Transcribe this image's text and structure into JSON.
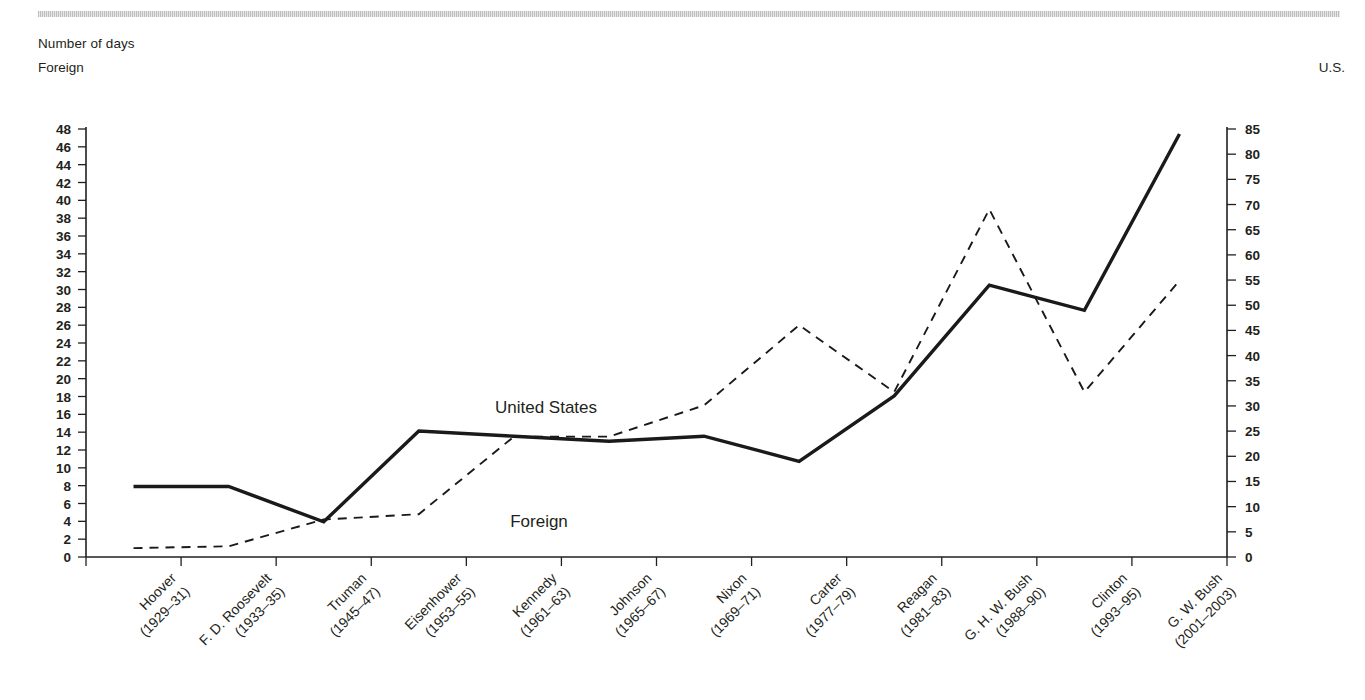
{
  "header": {
    "axis_units_title": "Number of days",
    "left_axis_name": "Foreign",
    "right_axis_name": "U.S."
  },
  "series_labels": {
    "us": "United States",
    "foreign": "Foreign"
  },
  "chart_data": {
    "type": "line",
    "title": "Number of days",
    "xlabel": "",
    "ylabel": "Foreign",
    "y2label": "U.S.",
    "ylim": [
      0,
      48
    ],
    "y2lim": [
      0,
      85
    ],
    "grid": false,
    "legend": "inline-annotations",
    "categories": [
      "Hoover\n(1929–31)",
      "F. D. Roosevelt\n(1933–35)",
      "Truman\n(1945–47)",
      "Eisenhower\n(1953–55)",
      "Kennedy\n(1961–63)",
      "Johnson\n(1965–67)",
      "Nixon\n(1969–71)",
      "Carter\n(1977–79)",
      "Reagan\n(1981–83)",
      "G. H. W. Bush\n(1988–90)",
      "Clinton\n(1993–95)",
      "G. W. Bush\n(2001–2003)"
    ],
    "category_names": [
      "Hoover",
      "F. D. Roosevelt",
      "Truman",
      "Eisenhower",
      "Kennedy",
      "Johnson",
      "Nixon",
      "Carter",
      "Reagan",
      "G. H. W. Bush",
      "Clinton",
      "G. W. Bush"
    ],
    "category_years": [
      "(1929–31)",
      "(1933–35)",
      "(1945–47)",
      "(1953–55)",
      "(1961–63)",
      "(1965–67)",
      "(1969–71)",
      "(1977–79)",
      "(1981–83)",
      "(1988–90)",
      "(1993–95)",
      "(2001–2003)"
    ],
    "series": [
      {
        "name": "United States",
        "axis": "right",
        "style": "solid",
        "values": [
          14,
          14,
          7,
          25,
          24,
          23,
          24,
          19,
          32,
          54,
          49,
          84
        ]
      },
      {
        "name": "Foreign",
        "axis": "left",
        "style": "dashed",
        "values": [
          1,
          1.2,
          4.2,
          4.8,
          13.5,
          13.5,
          17,
          26,
          18.5,
          39,
          18.5,
          31
        ]
      }
    ],
    "left_ticks": [
      0,
      2,
      4,
      6,
      8,
      10,
      12,
      14,
      16,
      18,
      20,
      22,
      24,
      26,
      28,
      30,
      32,
      34,
      36,
      38,
      40,
      42,
      44,
      46,
      48
    ],
    "right_ticks": [
      0,
      5,
      10,
      15,
      20,
      25,
      30,
      35,
      40,
      45,
      50,
      55,
      60,
      65,
      70,
      75,
      80,
      85
    ]
  },
  "colors": {
    "ink": "#231f20",
    "line": "#1a1a1a",
    "rule": "#b8b8b8"
  }
}
